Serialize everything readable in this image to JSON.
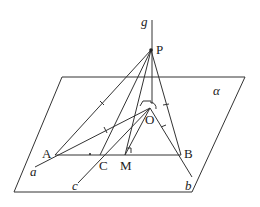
{
  "diagram": {
    "type": "3d-geometry",
    "plane_label": "α",
    "labels": {
      "g": "g",
      "P": "P",
      "O": "O",
      "A": "A",
      "B": "B",
      "C": "C",
      "M": "M",
      "a": "a",
      "b": "b",
      "c": "c",
      "alpha": "α"
    },
    "colors": {
      "stroke": "#333333",
      "background": "#ffffff"
    }
  }
}
